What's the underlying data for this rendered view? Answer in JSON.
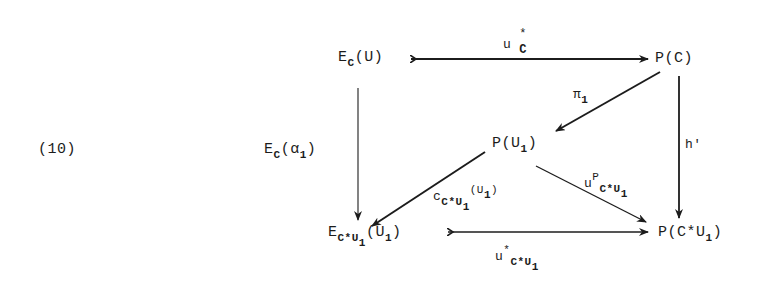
{
  "equation_number": "(10)",
  "nodes": {
    "ec_u": {
      "base": "E",
      "sub": "C",
      "arg": "(U)"
    },
    "p_c": {
      "text": "P(C)"
    },
    "p_u1": {
      "base": "P(U",
      "sub": "1",
      "close": ")"
    },
    "ecu1_u1": {
      "base": "E",
      "sub": "C*U",
      "subsub": "1",
      "arg_open": "(U",
      "arg_sub": "1",
      "arg_close": ")"
    },
    "p_cu1": {
      "base": "P(C*U",
      "sub": "1",
      "close": ")"
    }
  },
  "arrows": {
    "top": {
      "name": "u",
      "sup": "*",
      "sub": "C"
    },
    "left_vertical": {
      "base": "E",
      "sub": "C",
      "arg_open": "(α",
      "arg_sub": "1",
      "arg_close": ")"
    },
    "pi1": {
      "name": "π",
      "sub": "1"
    },
    "right_vertical": {
      "name": "h'"
    },
    "diag_left": {
      "base": "c",
      "sub": "C*U",
      "subsub": "1",
      "arg_open": "(U",
      "arg_sub": "1",
      "arg_close": ")"
    },
    "diag_right": {
      "name": "u",
      "sup": "P",
      "sub": "C*U",
      "subsub": "1"
    },
    "bottom": {
      "name": "u",
      "sup": "*",
      "sub": "C*U",
      "subsub": "1"
    }
  },
  "colors": {
    "ink": "#1c1c1c",
    "background": "#ffffff"
  }
}
